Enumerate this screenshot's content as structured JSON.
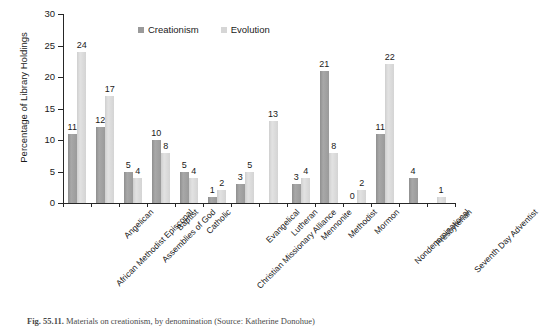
{
  "caption": {
    "figure_number": "Fig. 55.11.",
    "text": "Materials on creationism, by denomination (Source: Katherine Donohue)"
  },
  "legend": {
    "position": "top-center",
    "entries": [
      {
        "label": "Creationism",
        "color": "#9a9a9a",
        "icon": "square-swatch"
      },
      {
        "label": "Evolution",
        "color": "#d6d6d6",
        "icon": "square-swatch"
      }
    ]
  },
  "chart_data": {
    "type": "bar",
    "title": "",
    "subtitle": "",
    "xlabel": "",
    "ylabel": "Percentage of Library Holdings",
    "ylim": [
      0,
      30
    ],
    "yticks": [
      0,
      5,
      10,
      15,
      20,
      25,
      30
    ],
    "grid": false,
    "legend_position": "top-center",
    "categories": [
      "African Methodist Episcopal",
      "Angelican",
      "Assemblies of God",
      "Baptist",
      "Catholic",
      "Christian Missionary Alliance",
      "Evangelical",
      "Lutheran",
      "Mennonite",
      "Methodist",
      "Mormon",
      "Nondenominational",
      "Presbyterian",
      "Seventh Day Adventist"
    ],
    "series": [
      {
        "name": "Creationism",
        "color": "#9a9a9a",
        "values": [
          11,
          12,
          5,
          10,
          5,
          1,
          3,
          null,
          3,
          21,
          0,
          11,
          4,
          null
        ]
      },
      {
        "name": "Evolution",
        "color": "#d6d6d6",
        "values": [
          24,
          17,
          4,
          8,
          4,
          2,
          5,
          13,
          4,
          8,
          2,
          22,
          null,
          1
        ]
      }
    ],
    "data_labels": [
      {
        "category": "African Methodist Episcopal",
        "creationism": "11",
        "evolution": "24"
      },
      {
        "category": "Angelican",
        "creationism": "12",
        "evolution": "17"
      },
      {
        "category": "Assemblies of God",
        "creationism": "5",
        "evolution": "4"
      },
      {
        "category": "Baptist",
        "creationism": "10",
        "evolution": "8"
      },
      {
        "category": "Catholic",
        "creationism": "5",
        "evolution": "4"
      },
      {
        "category": "Christian Missionary Alliance",
        "creationism": "1",
        "evolution": "2"
      },
      {
        "category": "Evangelical",
        "creationism": "3",
        "evolution": "5"
      },
      {
        "category": "Lutheran",
        "creationism": "",
        "evolution": "13"
      },
      {
        "category": "Mennonite",
        "creationism": "3",
        "evolution": "4"
      },
      {
        "category": "Methodist",
        "creationism": "21",
        "evolution": "8"
      },
      {
        "category": "Mormon",
        "creationism": "0",
        "evolution": "2"
      },
      {
        "category": "Nondenominational",
        "creationism": "11",
        "evolution": "22"
      },
      {
        "category": "Presbyterian",
        "creationism": "4",
        "evolution": ""
      },
      {
        "category": "Seventh Day Adventist",
        "creationism": "",
        "evolution": "1"
      }
    ]
  }
}
